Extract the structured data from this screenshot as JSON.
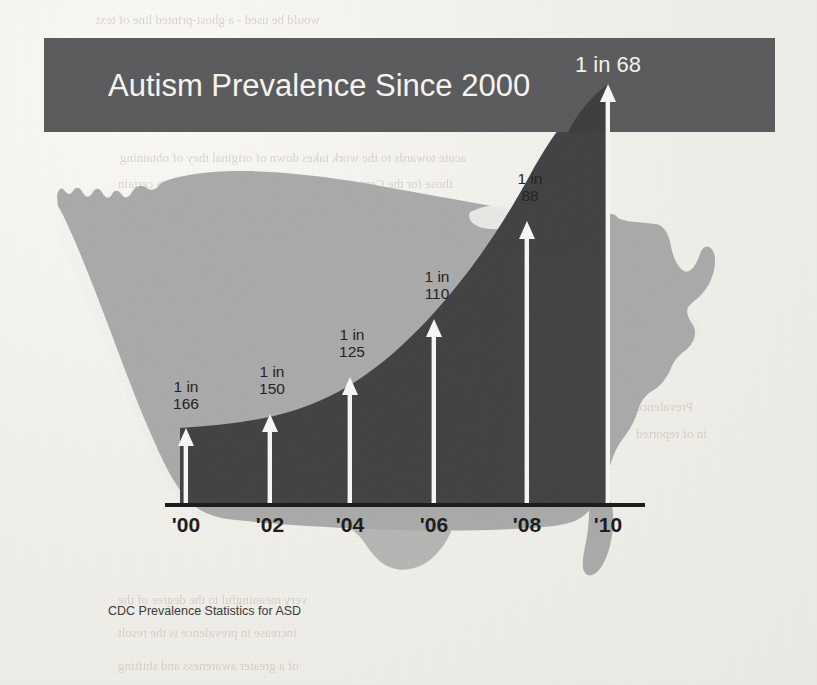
{
  "page": {
    "background_color": "#f1efea",
    "bleed_through_lines": [
      {
        "text": "would be used - a ghost-printed line of text",
        "x": 96,
        "y": 12,
        "size": 13
      },
      {
        "text": "acute towards to the work takes down of original they of obtaining",
        "x": 120,
        "y": 150,
        "size": 13
      },
      {
        "text": "those for the Center – based interest and science within a certain",
        "x": 118,
        "y": 176,
        "size": 13
      },
      {
        "text": "and the reports of prevalence of children",
        "x": 120,
        "y": 202,
        "size": 13
      },
      {
        "text": "Autism",
        "x": 636,
        "y": 345,
        "size": 13
      },
      {
        "text": "CDC",
        "x": 636,
        "y": 372,
        "size": 13
      },
      {
        "text": "Prevalence",
        "x": 636,
        "y": 399,
        "size": 13
      },
      {
        "text": "in of reported",
        "x": 636,
        "y": 426,
        "size": 13
      },
      {
        "text": "very meaningful to the degree of the",
        "x": 118,
        "y": 592,
        "size": 13
      },
      {
        "text": "increase in prevalence is the result",
        "x": 118,
        "y": 625,
        "size": 13
      },
      {
        "text": "of a greater awareness and shifting",
        "x": 118,
        "y": 658,
        "size": 13
      }
    ]
  },
  "figure": {
    "title": "Autism Prevalence Since 2000",
    "title_bar": {
      "color": "#58585a",
      "x": 44,
      "y": 38,
      "width": 731,
      "height": 94
    },
    "source_note": "CDC Prevalence Statistics for ASD",
    "colors": {
      "map_fill": "#a9a9a9",
      "area_fill": "#3f3f41",
      "arrow": "#f6f5f3",
      "axis": "#1c1c1c",
      "title_text": "#f4f3f0",
      "label_text": "#242424"
    },
    "axis": {
      "baseline_y": 505,
      "x_start": 180,
      "x_end": 640
    }
  },
  "chart_data": {
    "type": "area",
    "title": "Autism Prevalence Since 2000",
    "subtitle": "",
    "xlabel": "",
    "ylabel": "",
    "source": "CDC Prevalence Statistics for ASD",
    "grid": false,
    "legend": "none",
    "categories": [
      "'00",
      "'02",
      "'04",
      "'06",
      "'08",
      "'10"
    ],
    "x_tick_labels": [
      "'00",
      "'02",
      "'04",
      "'06",
      "'08",
      "'10"
    ],
    "point_labels": [
      "1 in\n166",
      "1 in\n150",
      "1 in\n125",
      "1 in\n110",
      "1 in\n88",
      "1 in 68"
    ],
    "denominators": [
      166,
      150,
      125,
      110,
      88,
      68
    ],
    "values_per_10000": [
      60.2,
      66.7,
      80.0,
      90.9,
      113.6,
      147.1
    ],
    "annotations": [
      {
        "year": "'00",
        "label_line1": "1 in",
        "label_line2": "166",
        "arrow_x": 186,
        "arrow_tip_y": 430,
        "label_x": 186,
        "label_y": 390
      },
      {
        "year": "'02",
        "label_line1": "1 in",
        "label_line2": "150",
        "arrow_x": 270,
        "arrow_tip_y": 414,
        "label_x": 272,
        "label_y": 374
      },
      {
        "year": "'04",
        "label_line1": "1 in",
        "label_line2": "125",
        "arrow_x": 350,
        "arrow_tip_y": 377,
        "label_x": 352,
        "label_y": 337
      },
      {
        "year": "'06",
        "label_line1": "1 in",
        "label_line2": "110",
        "arrow_x": 434,
        "arrow_tip_y": 319,
        "label_x": 437,
        "label_y": 279
      },
      {
        "year": "'08",
        "label_line1": "1 in",
        "label_line2": "88",
        "arrow_x": 527,
        "arrow_tip_y": 221,
        "label_x": 530,
        "label_y": 181
      },
      {
        "year": "'10",
        "label_line1": "1 in 68",
        "label_line2": "",
        "arrow_x": 608,
        "arrow_tip_y": 84,
        "label_x": 608,
        "label_y": 72
      }
    ]
  }
}
